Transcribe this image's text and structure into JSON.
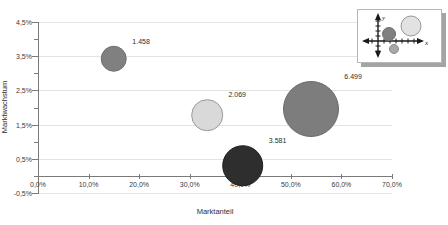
{
  "chart_data": {
    "type": "scatter",
    "subtype": "bubble",
    "title": "",
    "xlabel": "Marktanteil",
    "ylabel": "Marktwachstum",
    "xlim": [
      0,
      70
    ],
    "ylim": [
      -0.5,
      4.5
    ],
    "grid": true,
    "legend": "none",
    "x_tick_labels": [
      "0,0%",
      "10,0%",
      "20,0%",
      "30,0%",
      "40,0%",
      "50,0%",
      "60,0%",
      "70,0%"
    ],
    "x_tick_values": [
      0,
      10,
      20,
      30,
      40,
      50,
      60,
      70
    ],
    "y_tick_labels": [
      "-0,5%",
      "0,5%",
      "1,5%",
      "2,5%",
      "3,5%",
      "4,5%"
    ],
    "y_tick_values": [
      -0.5,
      0.5,
      1.5,
      2.5,
      3.5,
      4.5
    ],
    "y_minor_tick_values": [
      0.0,
      1.0,
      2.0,
      3.0,
      4.0
    ],
    "points": [
      {
        "label": "1.458",
        "x": 15.0,
        "y": 3.42,
        "size": 1458,
        "color": "#808080",
        "edge": "#6e6e6e"
      },
      {
        "label": "2.069",
        "x": 33.5,
        "y": 1.78,
        "size": 2069,
        "color": "#d9d9d9",
        "edge": "#9a9a9a"
      },
      {
        "label": "6.499",
        "x": 54.0,
        "y": 1.95,
        "size": 6499,
        "color": "#7d7d7d",
        "edge": "#6b6b6b"
      },
      {
        "label": "3.581",
        "x": 40.5,
        "y": 0.3,
        "size": 3581,
        "color": "#2e2e2e",
        "edge": "#1e1e1e"
      }
    ]
  },
  "axes": {
    "x_title": "Marktanteil",
    "y_title": "Marktwachstum"
  },
  "inset": {
    "name": "bubble-chart-thumbnail",
    "x_axis_label": "x",
    "y_axis_label": "y"
  },
  "colors": {
    "grid": "#e3e3e3",
    "axis": "#7a7a7a",
    "text": "#2e2e2e",
    "background": "#ffffff",
    "bubble_dark": "#2e2e2e",
    "bubble_medium": "#808080",
    "bubble_light": "#d9d9d9"
  }
}
